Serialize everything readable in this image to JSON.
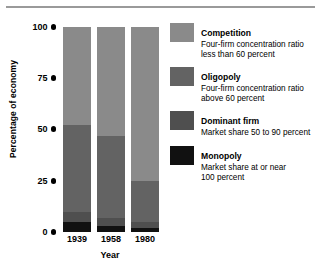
{
  "chart_data": {
    "type": "bar",
    "subtype": "stacked-bar",
    "title": "",
    "xlabel": "Year",
    "ylabel": "Percentage of economy",
    "categories": [
      "1939",
      "1958",
      "1980"
    ],
    "ylim": [
      0,
      100
    ],
    "yticks": [
      "0",
      "25",
      "50",
      "75",
      "100"
    ],
    "ytick_values": [
      0,
      25,
      50,
      75,
      100
    ],
    "grid": false,
    "legend_position": "right",
    "stack_order_bottom_to_top": [
      "Monopoly",
      "Dominant firm",
      "Oligopoly",
      "Competition"
    ],
    "series": [
      {
        "name": "Monopoly",
        "color": "#111111",
        "values": [
          5,
          3,
          2
        ]
      },
      {
        "name": "Dominant firm",
        "color": "#4f4f4f",
        "values": [
          5,
          4,
          3
        ]
      },
      {
        "name": "Oligopoly",
        "color": "#636363",
        "values": [
          42,
          40,
          20
        ]
      },
      {
        "name": "Competition",
        "color": "#8a8a8a",
        "values": [
          48,
          53,
          75
        ]
      }
    ]
  },
  "legend": {
    "entries": [
      {
        "title": "Competition",
        "desc_line1": "Four-firm concentration ratio",
        "desc_line2": "less than 60 percent",
        "color": "#8a8a8a"
      },
      {
        "title": "Oligopoly",
        "desc_line1": "Four-firm concentration ratio",
        "desc_line2": "above 60 percent",
        "color": "#636363"
      },
      {
        "title": "Dominant firm",
        "desc_line1": "Market share 50 to 90 percent",
        "desc_line2": "",
        "color": "#4f4f4f"
      },
      {
        "title": "Monopoly",
        "desc_line1": "Market share at or near",
        "desc_line2": "100 percent",
        "color": "#111111"
      }
    ]
  },
  "axes": {
    "y_title": "Percentage of economy",
    "x_title": "Year",
    "y_ticks": [
      "100",
      "75",
      "50",
      "25",
      "0"
    ],
    "x_ticks": [
      "1939",
      "1958",
      "1980"
    ]
  }
}
